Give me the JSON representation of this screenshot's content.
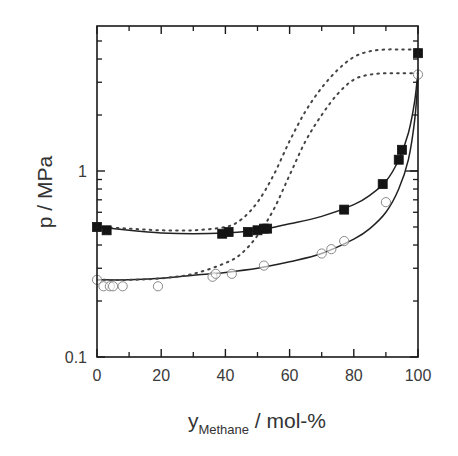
{
  "chart_data": {
    "type": "scatter",
    "title": "",
    "xlabel": "y_Methane / mol-%",
    "xlabel_main": "y",
    "xlabel_subscript": "Methane",
    "xlabel_unit": " / mol-%",
    "ylabel": "p / MPa",
    "xlim": [
      0,
      100
    ],
    "ylim": [
      0.1,
      6
    ],
    "yscale": "log",
    "x_ticks": [
      0,
      20,
      40,
      60,
      80,
      100
    ],
    "x_tick_labels": [
      "0",
      "20",
      "40",
      "60",
      "80",
      "100"
    ],
    "x_minor_ticks": [
      10,
      30,
      50,
      70,
      90
    ],
    "y_ticks": [
      0.1,
      1
    ],
    "y_tick_labels": [
      "0.1",
      "1"
    ],
    "grid": false,
    "legend": null,
    "series": [
      {
        "name": "experimental (filled squares, higher isotherm)",
        "marker": "filled-square",
        "x": [
          0,
          3,
          39,
          41,
          47,
          50,
          52,
          53,
          77,
          89,
          94,
          95,
          100
        ],
        "y": [
          0.5,
          0.48,
          0.46,
          0.47,
          0.47,
          0.48,
          0.49,
          0.49,
          0.62,
          0.85,
          1.15,
          1.3,
          4.3
        ]
      },
      {
        "name": "experimental (open circles, lower isotherm)",
        "marker": "open-circle",
        "x": [
          0,
          2,
          4,
          5,
          8,
          19,
          36,
          37,
          42,
          52,
          70,
          73,
          77,
          90,
          100
        ],
        "y": [
          0.26,
          0.24,
          0.24,
          0.24,
          0.24,
          0.24,
          0.27,
          0.28,
          0.28,
          0.31,
          0.36,
          0.38,
          0.42,
          0.68,
          3.3
        ]
      },
      {
        "name": "model curve (solid, upper)",
        "line": "solid",
        "x": [
          0,
          10,
          20,
          30,
          40,
          50,
          60,
          70,
          80,
          85,
          90,
          94,
          97,
          99,
          100
        ],
        "y": [
          0.5,
          0.48,
          0.465,
          0.46,
          0.465,
          0.48,
          0.52,
          0.57,
          0.66,
          0.74,
          0.88,
          1.15,
          1.6,
          2.4,
          3.5
        ]
      },
      {
        "name": "model curve (solid, lower)",
        "line": "solid",
        "x": [
          0,
          10,
          20,
          30,
          40,
          50,
          60,
          70,
          80,
          85,
          90,
          94,
          97,
          99,
          100
        ],
        "y": [
          0.26,
          0.26,
          0.265,
          0.275,
          0.285,
          0.3,
          0.325,
          0.36,
          0.43,
          0.49,
          0.6,
          0.8,
          1.15,
          1.9,
          3.2
        ]
      },
      {
        "name": "model curve (dotted, upper)",
        "line": "dotted",
        "x": [
          0,
          10,
          20,
          30,
          40,
          45,
          50,
          55,
          60,
          65,
          70,
          75,
          80,
          85,
          90,
          95,
          100
        ],
        "y": [
          0.5,
          0.49,
          0.48,
          0.48,
          0.5,
          0.55,
          0.68,
          0.95,
          1.45,
          2.1,
          2.8,
          3.5,
          4.1,
          4.4,
          4.5,
          4.5,
          4.5
        ]
      },
      {
        "name": "model curve (dotted, lower)",
        "line": "dotted",
        "x": [
          0,
          10,
          20,
          30,
          40,
          45,
          50,
          55,
          60,
          65,
          70,
          75,
          80,
          85,
          90,
          95,
          100
        ],
        "y": [
          0.26,
          0.26,
          0.265,
          0.28,
          0.32,
          0.36,
          0.45,
          0.62,
          0.95,
          1.45,
          2.0,
          2.6,
          3.1,
          3.3,
          3.35,
          3.35,
          3.35
        ]
      }
    ]
  },
  "axes": {
    "x_title_main": "y",
    "x_title_sub": "Methane",
    "x_title_unit": " / mol-%",
    "y_title": "p / MPa"
  }
}
